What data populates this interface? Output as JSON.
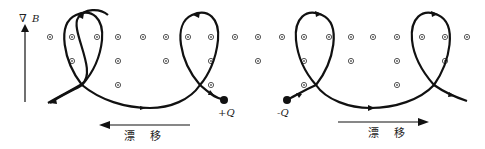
{
  "diagram": {
    "field_label": "B",
    "field_gradient_symbol": "∇",
    "charges": {
      "positive": "+Q",
      "negative": "-Q"
    },
    "drift_left_label": "漂 移",
    "drift_right_label": "漂 移",
    "colors": {
      "ink": "#111111",
      "dot": "#555555"
    },
    "field_dots": {
      "symbol": "out-of-page",
      "rows": [
        {
          "y": 37,
          "x": [
            50,
            72,
            97,
            118,
            143,
            166,
            188,
            211,
            235,
            258,
            282,
            304,
            329,
            351,
            373,
            397,
            422,
            445,
            467
          ]
        },
        {
          "y": 61,
          "x": [
            72,
            118,
            166,
            211,
            258,
            304,
            351,
            397,
            445
          ]
        },
        {
          "y": 85,
          "x": [
            118,
            211,
            304,
            397
          ]
        }
      ]
    }
  }
}
